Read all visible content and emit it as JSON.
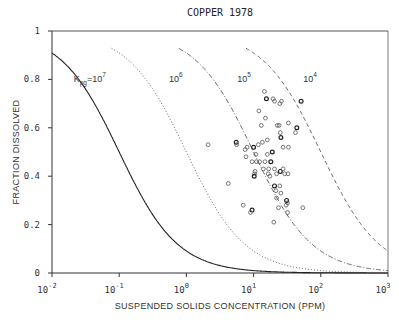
{
  "chart_data": {
    "type": "scatter",
    "title": "COPPER 1978",
    "xlabel": "SUSPENDED SOLIDS CONCENTRATION (PPM)",
    "ylabel": "FRACTION DISSOLVED",
    "xscale": "log",
    "xlim": [
      0.01,
      1000
    ],
    "ylim": [
      0,
      1
    ],
    "x_ticks": [
      {
        "base": "10",
        "exp": "-2",
        "value": 0.01
      },
      {
        "base": "10",
        "exp": "-1",
        "value": 0.1
      },
      {
        "base": "10",
        "exp": "0",
        "value": 1
      },
      {
        "base": "10",
        "exp": "1",
        "value": 10
      },
      {
        "base": "10",
        "exp": "2",
        "value": 100
      },
      {
        "base": "10",
        "exp": "3",
        "value": 1000
      }
    ],
    "y_ticks": [
      {
        "label": "0",
        "value": 0
      },
      {
        "label": "0.2",
        "value": 0.2
      },
      {
        "label": "0.4",
        "value": 0.4
      },
      {
        "label": "0.6",
        "value": 0.6
      },
      {
        "label": "0.8",
        "value": 0.8
      },
      {
        "label": "1",
        "value": 1
      }
    ],
    "grid": false,
    "curves": [
      {
        "name": "Kpg=10^7",
        "kpg": 10000000,
        "style": "solid",
        "label_prefix": "K",
        "label_sub": "pg",
        "label_base": "=10",
        "label_exp": "7",
        "label_x": 0.021,
        "label_y": 0.8
      },
      {
        "name": "10^6",
        "kpg": 1000000,
        "style": "dotted",
        "label_prefix": "",
        "label_sub": "",
        "label_base": "10",
        "label_exp": "6",
        "label_x": 0.55,
        "label_y": 0.8
      },
      {
        "name": "10^5",
        "kpg": 100000,
        "style": "dashdot",
        "label_prefix": "",
        "label_sub": "",
        "label_base": "10",
        "label_exp": "5",
        "label_x": 5.7,
        "label_y": 0.8
      },
      {
        "name": "10^4",
        "kpg": 10000,
        "style": "dashed",
        "label_prefix": "",
        "label_sub": "",
        "label_base": "10",
        "label_exp": "4",
        "label_x": 55,
        "label_y": 0.8
      }
    ],
    "curve_model": "fraction = 1 / (1 + Kpg * C * 1e-6)",
    "series": [
      {
        "name": "observations",
        "marker": "open-circle",
        "points": [
          [
            14.5,
            0.75
          ],
          [
            15.5,
            0.72
          ],
          [
            19.5,
            0.72
          ],
          [
            20.5,
            0.71
          ],
          [
            24.5,
            0.7
          ],
          [
            26,
            0.71
          ],
          [
            51,
            0.71
          ],
          [
            12,
            0.67
          ],
          [
            15,
            0.64
          ],
          [
            13,
            0.61
          ],
          [
            22.5,
            0.61
          ],
          [
            44,
            0.6
          ],
          [
            42,
            0.58
          ],
          [
            24,
            0.61
          ],
          [
            33,
            0.62
          ],
          [
            25,
            0.58
          ],
          [
            25.5,
            0.56
          ],
          [
            16,
            0.55
          ],
          [
            27.5,
            0.52
          ],
          [
            33,
            0.52
          ],
          [
            2.1,
            0.53
          ],
          [
            5.5,
            0.54
          ],
          [
            5.6,
            0.53
          ],
          [
            7.5,
            0.51
          ],
          [
            8,
            0.52
          ],
          [
            7.7,
            0.48
          ],
          [
            10,
            0.52
          ],
          [
            11.8,
            0.53
          ],
          [
            13.5,
            0.54
          ],
          [
            10.8,
            0.49
          ],
          [
            16,
            0.49
          ],
          [
            19,
            0.5
          ],
          [
            9.5,
            0.46
          ],
          [
            11,
            0.46
          ],
          [
            12.3,
            0.46
          ],
          [
            14.8,
            0.46
          ],
          [
            18,
            0.46
          ],
          [
            14,
            0.43
          ],
          [
            16.8,
            0.43
          ],
          [
            20.5,
            0.43
          ],
          [
            10.5,
            0.42
          ],
          [
            10.2,
            0.4
          ],
          [
            17.5,
            0.4
          ],
          [
            10.3,
            0.41
          ],
          [
            16.5,
            0.41
          ],
          [
            22,
            0.41
          ],
          [
            25,
            0.42
          ],
          [
            27.5,
            0.43
          ],
          [
            29,
            0.41
          ],
          [
            32.5,
            0.41
          ],
          [
            4.2,
            0.37
          ],
          [
            20.5,
            0.36
          ],
          [
            24.5,
            0.36
          ],
          [
            21.5,
            0.34
          ],
          [
            25.5,
            0.33
          ],
          [
            22,
            0.31
          ],
          [
            31,
            0.3
          ],
          [
            32,
            0.29
          ],
          [
            23.5,
            0.27
          ],
          [
            30.5,
            0.28
          ],
          [
            54,
            0.27
          ],
          [
            9.5,
            0.26
          ],
          [
            9.0,
            0.25
          ],
          [
            32,
            0.25
          ],
          [
            20,
            0.21
          ],
          [
            7.0,
            0.28
          ]
        ]
      }
    ]
  }
}
